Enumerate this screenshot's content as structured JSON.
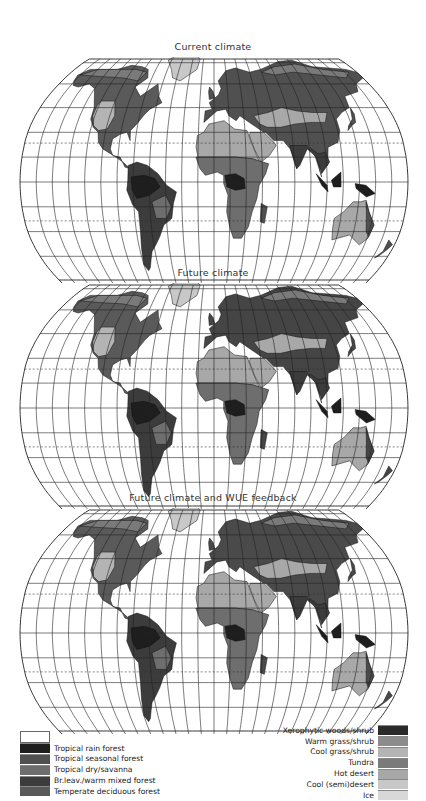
{
  "panels": [
    {
      "title": "Current climate",
      "top": 44,
      "title_top": 41
    },
    {
      "title": "Future climate",
      "top": 280,
      "title_top": 267
    },
    {
      "title": "Future climate and WUE feedback",
      "top": 508,
      "title_top": 492
    }
  ],
  "map": {
    "projection": "Robinson",
    "graticule_lon_step_deg": 15,
    "graticule_lat_step_deg": 15,
    "dashed_lines": [
      "Tropic of Cancer",
      "Tropic of Capricorn"
    ]
  },
  "legend": {
    "left": [
      {
        "label": "",
        "color": "#ffffff"
      },
      {
        "label": "Tropical rain forest",
        "color": "#1e1e1e"
      },
      {
        "label": "Tropical seasonal forest",
        "color": "#505050"
      },
      {
        "label": "Tropical dry/savanna",
        "color": "#6e6e6e"
      },
      {
        "label": "Br.leav./warm mixed forest",
        "color": "#3c3c3c"
      },
      {
        "label": "Temperate deciduous forest",
        "color": "#5a5a5a"
      }
    ],
    "right": [
      {
        "label": "Xerophytic woods/shrub",
        "color": "#2a2a2a"
      },
      {
        "label": "Warm grass/shrub",
        "color": "#8c8c8c"
      },
      {
        "label": "Cool grass/shrub",
        "color": "#b4b4b4"
      },
      {
        "label": "Tundra",
        "color": "#7a7a7a"
      },
      {
        "label": "Hot desert",
        "color": "#a8a8a8"
      },
      {
        "label": "Cool (semi)desert",
        "color": "#c8c8c8"
      },
      {
        "label": "Ice",
        "color": "#d8d8d8"
      }
    ]
  }
}
